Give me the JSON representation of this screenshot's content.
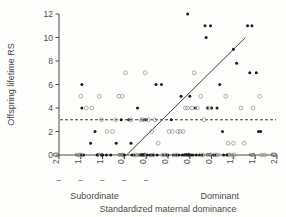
{
  "chart_data": {
    "type": "scatter",
    "title": "",
    "xlabel": "Standardized maternal dominance",
    "ylabel": "Offspring lifetime RS",
    "xlim": [
      -2.0,
      2.0
    ],
    "ylim": [
      0,
      12
    ],
    "xticks": [
      -2.0,
      -1.6,
      -1.2,
      -0.8,
      -0.4,
      0,
      0.4,
      0.8,
      1.2,
      1.6,
      2.0
    ],
    "xticklabels": [
      "-2.0",
      "-1.6",
      "-1.2",
      "-0.8",
      "-0.4",
      "0",
      "0.4",
      "0.8",
      "1.2",
      "1.6",
      "2.0"
    ],
    "yticks": [
      0,
      2,
      4,
      6,
      8,
      10,
      12
    ],
    "yticklabels": [
      "0",
      "2",
      "4",
      "6",
      "8",
      "10",
      "12"
    ],
    "grid": false,
    "legend": "none",
    "x_axis_annotations": [
      {
        "text": "Subordinate",
        "x": -1.35
      },
      {
        "text": "Dominant",
        "x": 0.95
      }
    ],
    "reference_line": {
      "orientation": "horizontal",
      "value": 3,
      "style": "dashed",
      "label": ""
    },
    "trend_line": {
      "style": "solid",
      "x_start": -0.76,
      "y_start": 0,
      "x_end": 1.42,
      "y_end": 10.0
    },
    "series": [
      {
        "name": "filled",
        "marker": "filled-circle",
        "color": "#1c1c1c",
        "points": [
          [
            -1.58,
            6
          ],
          [
            -1.58,
            4
          ],
          [
            -1.58,
            0
          ],
          [
            -1.55,
            0
          ],
          [
            -1.42,
            1
          ],
          [
            -1.34,
            2
          ],
          [
            -1.3,
            0
          ],
          [
            -1.22,
            0
          ],
          [
            -1.2,
            0
          ],
          [
            -1.13,
            0
          ],
          [
            -1.05,
            0
          ],
          [
            -0.95,
            1
          ],
          [
            -0.86,
            3
          ],
          [
            -0.8,
            0
          ],
          [
            -0.72,
            3
          ],
          [
            -0.68,
            1
          ],
          [
            -0.66,
            0
          ],
          [
            -0.62,
            0
          ],
          [
            -0.56,
            4
          ],
          [
            -0.52,
            0
          ],
          [
            -0.48,
            0
          ],
          [
            -0.46,
            0
          ],
          [
            -0.43,
            3
          ],
          [
            -0.4,
            3
          ],
          [
            -0.38,
            0
          ],
          [
            -0.33,
            0
          ],
          [
            -0.3,
            0
          ],
          [
            -0.26,
            0
          ],
          [
            -0.22,
            6
          ],
          [
            -0.2,
            0
          ],
          [
            -0.12,
            6
          ],
          [
            -0.08,
            0
          ],
          [
            -0.02,
            0
          ],
          [
            0.0,
            0
          ],
          [
            0.06,
            3
          ],
          [
            0.1,
            0
          ],
          [
            0.16,
            0
          ],
          [
            0.2,
            0
          ],
          [
            0.24,
            5
          ],
          [
            0.26,
            0
          ],
          [
            0.3,
            0
          ],
          [
            0.34,
            0
          ],
          [
            0.36,
            12
          ],
          [
            0.38,
            0
          ],
          [
            0.4,
            5
          ],
          [
            0.42,
            0
          ],
          [
            0.46,
            0
          ],
          [
            0.5,
            4
          ],
          [
            0.52,
            0
          ],
          [
            0.58,
            0
          ],
          [
            0.62,
            0
          ],
          [
            0.68,
            11
          ],
          [
            0.7,
            10
          ],
          [
            0.72,
            4
          ],
          [
            0.78,
            11
          ],
          [
            0.8,
            4
          ],
          [
            0.84,
            0
          ],
          [
            0.86,
            0
          ],
          [
            0.9,
            4
          ],
          [
            0.95,
            6
          ],
          [
            1.0,
            2
          ],
          [
            1.02,
            0
          ],
          [
            1.08,
            0
          ],
          [
            1.2,
            9
          ],
          [
            1.26,
            7.8
          ],
          [
            1.46,
            11
          ],
          [
            1.54,
            11
          ],
          [
            1.5,
            7
          ],
          [
            1.62,
            7
          ],
          [
            1.66,
            2
          ],
          [
            1.7,
            2
          ]
        ]
      },
      {
        "name": "open",
        "marker": "open-circle",
        "color": "#9a9a9a",
        "points": [
          [
            -1.6,
            5
          ],
          [
            -1.6,
            0
          ],
          [
            -1.5,
            4
          ],
          [
            -1.4,
            4
          ],
          [
            -1.26,
            5
          ],
          [
            -1.22,
            3
          ],
          [
            -1.12,
            2
          ],
          [
            -1.02,
            2
          ],
          [
            -0.96,
            3
          ],
          [
            -0.9,
            5
          ],
          [
            -0.84,
            5
          ],
          [
            -0.78,
            7
          ],
          [
            -0.68,
            3
          ],
          [
            -0.6,
            0
          ],
          [
            -0.56,
            0
          ],
          [
            -0.5,
            3
          ],
          [
            -0.46,
            3
          ],
          [
            -0.42,
            7
          ],
          [
            -0.36,
            3
          ],
          [
            -0.3,
            2
          ],
          [
            -0.28,
            0
          ],
          [
            -0.24,
            3
          ],
          [
            -0.18,
            1
          ],
          [
            -0.1,
            0
          ],
          [
            -0.04,
            0
          ],
          [
            0.02,
            2
          ],
          [
            0.08,
            2
          ],
          [
            0.14,
            0
          ],
          [
            0.18,
            2
          ],
          [
            0.22,
            2
          ],
          [
            0.28,
            2
          ],
          [
            0.32,
            4
          ],
          [
            0.36,
            4
          ],
          [
            0.44,
            4
          ],
          [
            0.48,
            7
          ],
          [
            0.54,
            4
          ],
          [
            0.6,
            5
          ],
          [
            0.64,
            0
          ],
          [
            0.66,
            3
          ],
          [
            0.74,
            4
          ],
          [
            0.88,
            0
          ],
          [
            0.92,
            0
          ],
          [
            1.06,
            5
          ],
          [
            1.1,
            1
          ],
          [
            1.14,
            0
          ],
          [
            1.2,
            1
          ],
          [
            1.22,
            0
          ],
          [
            1.34,
            4
          ],
          [
            1.4,
            1
          ],
          [
            1.56,
            4
          ],
          [
            1.68,
            5
          ],
          [
            1.72,
            0
          ],
          [
            1.78,
            0
          ]
        ]
      }
    ]
  }
}
